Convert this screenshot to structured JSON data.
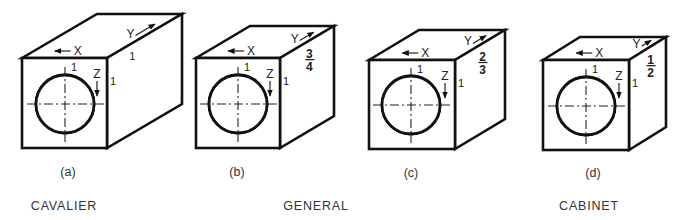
{
  "figure": {
    "panels": [
      {
        "id": "a",
        "label": "(a)",
        "depth_ratio": "1",
        "depth_num": "",
        "depth_den": "",
        "x_axis": "X",
        "y_axis": "Y",
        "z_axis": "Z",
        "unit_top": "1",
        "unit_side": "1",
        "unit_depth": "1",
        "front": {
          "x": 22,
          "y": 58,
          "w": 85,
          "h": 90
        },
        "offset": {
          "dx": 75,
          "dy": -44
        },
        "hole": {
          "cx": 65,
          "cy": 104,
          "r": 29
        },
        "label_pos": {
          "x": 68,
          "y": 176
        }
      },
      {
        "id": "b",
        "label": "(b)",
        "depth_ratio": "3/4",
        "depth_num": "3",
        "depth_den": "4",
        "x_axis": "X",
        "y_axis": "Y",
        "z_axis": "Z",
        "unit_top": "1",
        "unit_side": "1",
        "front": {
          "x": 196,
          "y": 58,
          "w": 84,
          "h": 90
        },
        "offset": {
          "dx": 54,
          "dy": -32
        },
        "hole": {
          "cx": 238,
          "cy": 104,
          "r": 29
        },
        "label_pos": {
          "x": 237,
          "y": 176
        }
      },
      {
        "id": "c",
        "label": "(c)",
        "depth_ratio": "2/3",
        "depth_num": "2",
        "depth_den": "3",
        "x_axis": "X",
        "y_axis": "Y",
        "z_axis": "Z",
        "unit_top": "1",
        "unit_side": "1",
        "front": {
          "x": 369,
          "y": 60,
          "w": 86,
          "h": 89
        },
        "offset": {
          "dx": 50,
          "dy": -30
        },
        "hole": {
          "cx": 411,
          "cy": 105,
          "r": 29
        },
        "label_pos": {
          "x": 411,
          "y": 177
        }
      },
      {
        "id": "d",
        "label": "(d)",
        "depth_ratio": "1/2",
        "depth_num": "1",
        "depth_den": "2",
        "x_axis": "X",
        "y_axis": "Y",
        "z_axis": "Z",
        "unit_top": "1",
        "unit_side": "1",
        "front": {
          "x": 543,
          "y": 60,
          "w": 86,
          "h": 90
        },
        "offset": {
          "dx": 37,
          "dy": -23
        },
        "hole": {
          "cx": 586,
          "cy": 106,
          "r": 29
        },
        "label_pos": {
          "x": 593,
          "y": 177
        }
      }
    ],
    "captions": [
      {
        "text": "CAVALIER",
        "x": 64,
        "y": 210
      },
      {
        "text": "GENERAL",
        "x": 316,
        "y": 210
      },
      {
        "text": "CABINET",
        "x": 589,
        "y": 210
      }
    ],
    "colors": {
      "ink": "#111111",
      "background": "#ffffff"
    }
  }
}
